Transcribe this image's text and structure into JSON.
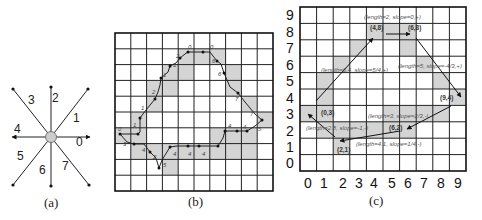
{
  "panels": {
    "a": {
      "caption": "(a)",
      "center": [
        51,
        137
      ],
      "directions": [
        {
          "code": "0",
          "angle": 0,
          "label_pos": [
            76,
            146
          ]
        },
        {
          "code": "1",
          "angle": 45,
          "label_pos": [
            73,
            122
          ]
        },
        {
          "code": "2",
          "angle": 90,
          "label_pos": [
            52,
            100
          ]
        },
        {
          "code": "3",
          "angle": 135,
          "label_pos": [
            28,
            102
          ]
        },
        {
          "code": "4",
          "angle": 180,
          "label_pos": [
            14,
            131
          ]
        },
        {
          "code": "5",
          "angle": 225,
          "label_pos": [
            17,
            158
          ]
        },
        {
          "code": "6",
          "angle": 270,
          "label_pos": [
            39,
            172
          ]
        },
        {
          "code": "7",
          "angle": 315,
          "label_pos": [
            62,
            168
          ]
        }
      ]
    },
    "b": {
      "caption": "(b)",
      "grid": {
        "x": 115,
        "y": 33,
        "cols": 10,
        "rows": 10,
        "cell": 15.8
      },
      "chain_codes": [
        "0",
        "0",
        "6",
        "6",
        "6",
        "7",
        "7",
        "7",
        "6",
        "6",
        "6",
        "4",
        "4",
        "4",
        "4",
        "4",
        "5",
        "3",
        "2",
        "4",
        "4",
        "3",
        "2",
        "2",
        "1",
        "1",
        "2",
        "2",
        "1",
        "1",
        "2",
        "2",
        "1",
        "0",
        "2",
        "0"
      ]
    },
    "c": {
      "caption": "(c)",
      "x_ticks": [
        "0",
        "1",
        "2",
        "3",
        "4",
        "5",
        "6",
        "7",
        "8",
        "9"
      ],
      "y_ticks": [
        "9",
        "8",
        "7",
        "6",
        "5",
        "4",
        "3",
        "2",
        "1",
        "0"
      ],
      "points": [
        {
          "label": "(4,8)"
        },
        {
          "label": "(6,8)"
        },
        {
          "label": "(9,4)"
        },
        {
          "label": "(6,2)"
        },
        {
          "label": "(2,1)"
        },
        {
          "label": "(0,3)"
        }
      ],
      "segments": [
        {
          "label": "(length=2, slope=0,+)"
        },
        {
          "label": "(length=6.4, slope=5/4,+)"
        },
        {
          "label": "(length=5, slope=-4/3,+)"
        },
        {
          "label": "(length=3, slope=2/3,-)"
        },
        {
          "label": "(length=2.8, slope=-1,-)"
        },
        {
          "label": "(length=4.1, slope=1/4,-)"
        }
      ]
    }
  }
}
